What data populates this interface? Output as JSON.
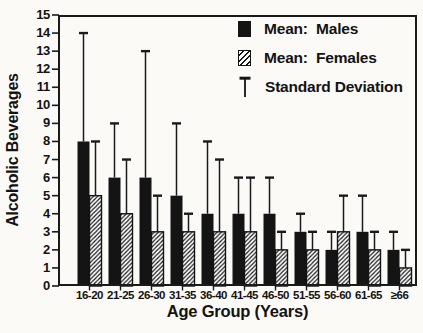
{
  "chart_data": {
    "type": "bar",
    "title": "",
    "xlabel": "Age Group (Years)",
    "ylabel": "Alcoholic Beverages",
    "categories": [
      "16-20",
      "21-25",
      "26-30",
      "31-35",
      "36-40",
      "41-45",
      "46-50",
      "51-55",
      "56-60",
      "61-65",
      "≥66"
    ],
    "series": [
      {
        "name": "Mean: Males",
        "style": "solid-black",
        "values": [
          8,
          6,
          6,
          5,
          4,
          4,
          4,
          3,
          2,
          3,
          2
        ],
        "sd": [
          6,
          3,
          7,
          4,
          4,
          2,
          2,
          1,
          1,
          2,
          1
        ],
        "sd_whisker_tops": [
          14,
          9,
          13,
          9,
          8,
          6,
          6,
          4,
          3,
          5,
          3
        ]
      },
      {
        "name": "Mean: Females",
        "style": "hatched-white",
        "values": [
          5,
          4,
          3,
          3,
          3,
          3,
          2,
          2,
          3,
          2,
          1
        ],
        "sd": [
          3,
          3,
          2,
          1,
          4,
          3,
          1,
          1,
          2,
          1,
          1
        ],
        "sd_whisker_tops": [
          8,
          7,
          5,
          4,
          7,
          6,
          3,
          3,
          5,
          3,
          2
        ]
      }
    ],
    "error_bars": "upper standard-deviation whisker with cap on every bar",
    "ylim": [
      0,
      15
    ],
    "yticks": [
      0,
      1,
      2,
      3,
      4,
      5,
      6,
      7,
      8,
      9,
      10,
      11,
      12,
      13,
      14,
      15
    ],
    "grid": false,
    "legend_position": "inside plot, top-right"
  },
  "legend": {
    "males": "Mean:  Males",
    "females": "Mean:  Females",
    "sd": "Standard Deviation"
  },
  "colors": {
    "bar_male": "#141414",
    "bar_outline": "#141414",
    "frame": "#1a1a1a",
    "text": "#131313",
    "background": "#fbfaf7"
  }
}
